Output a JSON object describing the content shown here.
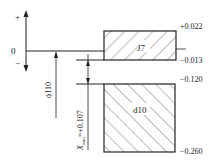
{
  "diagram": {
    "type": "tolerance-zone-diagram",
    "axis": {
      "plus_label": "+",
      "zero_label": "0",
      "minus_label": "−"
    },
    "hole_zone": {
      "label": "J7",
      "upper_deviation": "+0.022",
      "lower_deviation": "−0.013"
    },
    "shaft_zone": {
      "label": "d10",
      "upper_deviation": "−0.120",
      "lower_deviation": "−0.260"
    },
    "basic_size_label": "ϕ110",
    "clearance": {
      "symbol": "X",
      "subscript": "min",
      "value": "=+0.107"
    },
    "colors": {
      "line": "#222222",
      "hatch": "#555555",
      "background": "#ffffff"
    }
  }
}
